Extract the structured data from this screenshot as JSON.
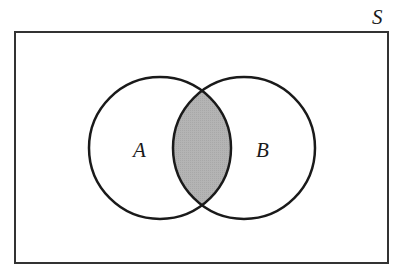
{
  "diagram": {
    "type": "venn",
    "universe": {
      "label": "S",
      "x": 15,
      "y": 32,
      "width": 373,
      "height": 231
    },
    "sets": [
      {
        "label": "A",
        "cx": 160,
        "cy": 148,
        "r": 71
      },
      {
        "label": "B",
        "cx": 244,
        "cy": 148,
        "r": 71
      }
    ],
    "shaded_region": "A ∩ B",
    "colors": {
      "stroke": "#1a1a1a",
      "frame": "#333333",
      "shade": "#b4b4b4",
      "background": "#ffffff"
    }
  }
}
